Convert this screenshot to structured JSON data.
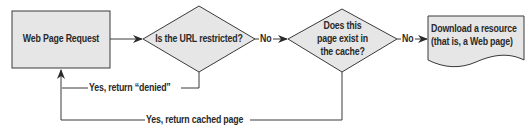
{
  "diagram": {
    "type": "flowchart",
    "colors": {
      "shape_fill": "#e6e6e6",
      "stroke": "#3a3a3a",
      "text": "#2a2a2a",
      "background": "#ffffff"
    },
    "nodes": [
      {
        "id": "request",
        "shape": "rectangle",
        "label": "Web Page Request"
      },
      {
        "id": "restricted",
        "shape": "diamond",
        "label": "Is the URL restricted?"
      },
      {
        "id": "cache",
        "shape": "diamond",
        "label_lines": [
          "Does this",
          "page exist in",
          "the cache?"
        ]
      },
      {
        "id": "download",
        "shape": "document",
        "label_lines": [
          "Download a resource",
          "(that is, a Web page)"
        ]
      }
    ],
    "edges": [
      {
        "from": "request",
        "to": "restricted",
        "label": ""
      },
      {
        "from": "restricted",
        "to": "cache",
        "label": "No"
      },
      {
        "from": "cache",
        "to": "download",
        "label": "No"
      },
      {
        "from": "restricted",
        "to": "request",
        "label": "Yes, return “denied”"
      },
      {
        "from": "cache",
        "to": "request",
        "label": "Yes, return cached page"
      }
    ]
  }
}
